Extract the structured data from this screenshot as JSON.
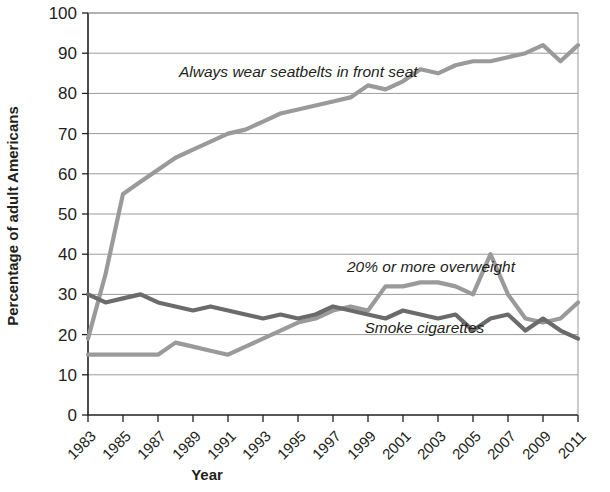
{
  "chart_data": {
    "type": "line",
    "title": "",
    "xlabel": "Year",
    "ylabel": "Percentage of adult Americans",
    "xlim": [
      1983,
      2011
    ],
    "ylim": [
      0,
      100
    ],
    "ytick_step": 10,
    "xtick_step": 2,
    "grid": true,
    "legend": "inline-annotations",
    "x": [
      1983,
      1984,
      1985,
      1986,
      1987,
      1988,
      1989,
      1990,
      1991,
      1992,
      1993,
      1994,
      1995,
      1996,
      1997,
      1998,
      1999,
      2000,
      2001,
      2002,
      2003,
      2004,
      2005,
      2006,
      2007,
      2008,
      2009,
      2010,
      2011
    ],
    "ytick_labels": [
      "0",
      "10",
      "20",
      "30",
      "40",
      "50",
      "60",
      "70",
      "80",
      "90",
      "100"
    ],
    "xtick_labels": [
      "1983",
      "1985",
      "1987",
      "1989",
      "1991",
      "1993",
      "1995",
      "1997",
      "1999",
      "2001",
      "2003",
      "2005",
      "2007",
      "2009",
      "2011"
    ],
    "series": [
      {
        "name": "Always wear seatbelts in front seat",
        "color": "#9a9a9a",
        "label_x": 1988.2,
        "label_y": 84,
        "values": [
          19,
          35,
          55,
          58,
          61,
          64,
          66,
          68,
          70,
          71,
          73,
          75,
          76,
          77,
          78,
          79,
          82,
          81,
          83,
          86,
          85,
          87,
          88,
          88,
          89,
          90,
          92,
          88,
          92
        ]
      },
      {
        "name": "20% or more overweight",
        "color": "#9a9a9a",
        "label_x": 1997.8,
        "label_y": 35.5,
        "values": [
          15,
          15,
          15,
          15,
          15,
          18,
          17,
          16,
          15,
          17,
          19,
          21,
          23,
          24,
          26,
          27,
          26,
          32,
          32,
          33,
          33,
          32,
          30,
          40,
          30,
          24,
          23,
          24,
          28
        ]
      },
      {
        "name": "Smoke cigarettes",
        "color": "#6b6b6b",
        "label_x": 1998.8,
        "label_y": 20.5,
        "values": [
          30,
          28,
          29,
          30,
          28,
          27,
          26,
          27,
          26,
          25,
          24,
          25,
          24,
          25,
          27,
          26,
          25,
          24,
          26,
          25,
          24,
          25,
          21,
          24,
          25,
          21,
          24,
          21,
          19
        ]
      }
    ]
  },
  "annotations": {
    "seatbelt": "Always wear seatbelts in front seat",
    "overweight": "20% or more overweight",
    "smoke": "Smoke cigarettes"
  },
  "axes": {
    "x_title": "Year",
    "y_title": "Percentage of adult Americans"
  }
}
